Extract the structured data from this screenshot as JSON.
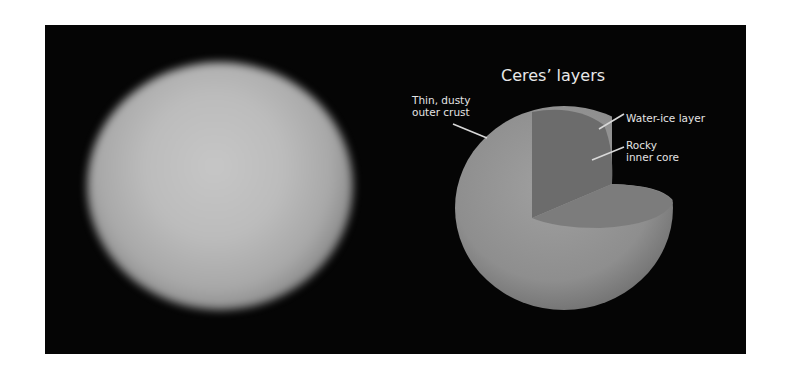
{
  "left_image": {
    "description": "Blurry telescope photograph of Ceres",
    "icon": "ceres-photo"
  },
  "right_diagram": {
    "title": "Ceres’ layers",
    "labels": {
      "crust_line1": "Thin, dusty",
      "crust_line2": "outer crust",
      "water_ice": "Water-ice layer",
      "core_line1": "Rocky",
      "core_line2": "inner core"
    }
  },
  "colors": {
    "background": "#050505",
    "page": "#ffffff",
    "text": "#e4e4e4",
    "outer_surface": "#929292",
    "cut_vertical_face": "#6c6c6c",
    "cut_horizontal_face": "#7c7c7c",
    "leader_line": "#d8d8d8"
  }
}
